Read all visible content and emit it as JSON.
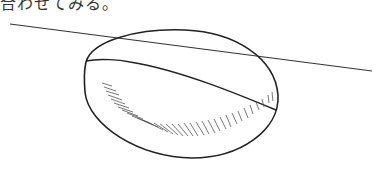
{
  "caption": {
    "text": "合わせてみる。"
  },
  "figure": {
    "stroke_color": "#222222",
    "hatch_color": "#555555",
    "elements": [
      "outer-ellipse",
      "straight-intersecting-line",
      "curved-section-line",
      "hatch-shading"
    ]
  }
}
